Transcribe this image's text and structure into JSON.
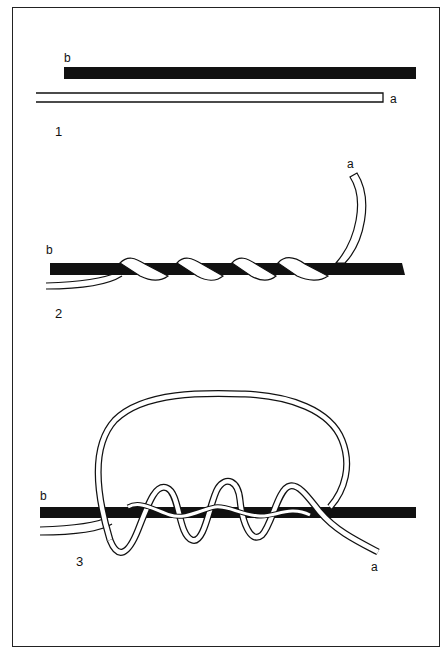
{
  "diagram": {
    "type": "knot-tying-steps",
    "stages": [
      {
        "number": "1",
        "labels": {
          "standing_line": "b",
          "working_end": "a"
        },
        "description": "two lines laid parallel"
      },
      {
        "number": "2",
        "labels": {
          "standing_line": "b",
          "working_end": "a"
        },
        "description": "line a wrapped four times around line b"
      },
      {
        "number": "3",
        "labels": {
          "standing_line": "b",
          "working_end": "a"
        },
        "description": "line a forms loop and returns through wraps"
      }
    ],
    "colors": {
      "line_b": "#111111",
      "line_a_fill": "#ffffff",
      "outline": "#111111",
      "frame": "#222222"
    }
  }
}
